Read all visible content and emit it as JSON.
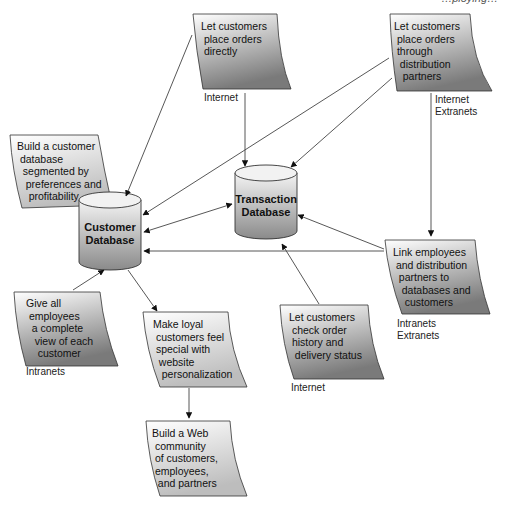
{
  "header": {
    "cropped_text": "…ploying…"
  },
  "databases": {
    "customer": {
      "line1": "Customer",
      "line2": "Database"
    },
    "transaction": {
      "line1": "Transaction",
      "line2": "Database"
    }
  },
  "notes": {
    "place_direct": {
      "text": "Let customers\n place orders\n directly",
      "label": "Internet"
    },
    "place_partners": {
      "text": "Let customers\n place orders\n through\n  distribution\n   partners",
      "label": "Internet\nExtranets"
    },
    "build_db": {
      "text": "Build a customer\n database\n  segmented by\n   preferences and\n    profitability"
    },
    "link_employees": {
      "text": "Link employees\n and distribution\n  partners to\n   databases and\n    customers",
      "label": "Intranets\nExtranets"
    },
    "give_employees": {
      "text": "Give all\n employees\n  a complete\n   view of each\n    customer",
      "label": "Intranets"
    },
    "make_loyal": {
      "text": "Make loyal\n customers feel\n special with\n  website\n   personalization"
    },
    "check_order": {
      "text": "Let customers\n check order\n history and\n  delivery status",
      "label": "Internet"
    },
    "web_community": {
      "text": "Build a Web\n community\n of customers,\n employees,\n  and partners"
    }
  },
  "colors": {
    "dark_grad_end": "#7a7a7a",
    "light_grad_end": "#b9b9b9",
    "line": "#444444"
  }
}
